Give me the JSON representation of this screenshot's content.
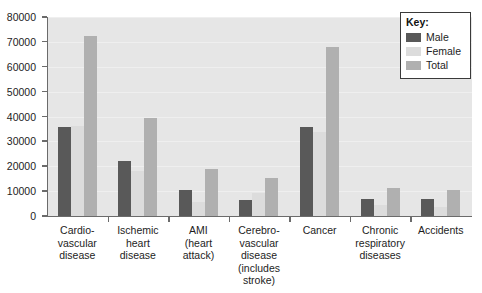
{
  "chart_data": {
    "type": "bar",
    "title": "",
    "subtitle": "",
    "xlabel": "",
    "ylabel": "",
    "ylim": [
      0,
      80000
    ],
    "ytick_labels": [
      "0",
      "10000",
      "20000",
      "30000",
      "40000",
      "50000",
      "60000",
      "70000",
      "80000"
    ],
    "yticks": [
      0,
      10000,
      20000,
      30000,
      40000,
      50000,
      60000,
      70000,
      80000
    ],
    "grid": true,
    "legend_position": "top-right",
    "categories": [
      "Cardio-\nvascular\ndisease",
      "Ischemic\nheart\ndisease",
      "AMI\n(heart\nattack)",
      "Cerebro-\nvascular\ndisease\n(includes\nstroke)",
      "Cancer",
      "Chronic\nrespiratory\ndiseases",
      "Accidents"
    ],
    "series": [
      {
        "name": "Male",
        "color": "#595959",
        "values": [
          35800,
          22100,
          10500,
          6400,
          35800,
          7000,
          7000
        ]
      },
      {
        "name": "Female",
        "color": "#dcdcdc",
        "values": [
          36200,
          18000,
          5600,
          9200,
          33700,
          4500,
          3500
        ]
      },
      {
        "name": "Total",
        "color": "#b0b0b0",
        "values": [
          72500,
          39500,
          18700,
          15200,
          68000,
          11200,
          10500
        ]
      }
    ]
  },
  "legend": {
    "title": "Key:",
    "entries": [
      {
        "label": "Male"
      },
      {
        "label": "Female"
      },
      {
        "label": "Total"
      }
    ]
  },
  "x_labels": [
    {
      "lines": [
        "Cardio-",
        "vascular",
        "disease"
      ]
    },
    {
      "lines": [
        "Ischemic",
        "heart",
        "disease"
      ]
    },
    {
      "lines": [
        "AMI",
        "(heart",
        "attack)"
      ]
    },
    {
      "lines": [
        "Cerebro-",
        "vascular",
        "disease",
        "(includes",
        "stroke)"
      ]
    },
    {
      "lines": [
        "Cancer"
      ]
    },
    {
      "lines": [
        "Chronic",
        "respiratory",
        "diseases"
      ]
    },
    {
      "lines": [
        "Accidents"
      ]
    }
  ]
}
